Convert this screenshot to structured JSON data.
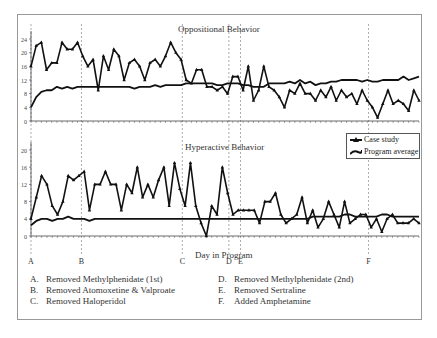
{
  "chart_data": [
    {
      "type": "line",
      "title": "Oppositional Behavior",
      "xlabel": "Day in Program",
      "ylabel": "",
      "ylim": [
        0,
        26
      ],
      "yticks": [
        0,
        4,
        8,
        12,
        16,
        20,
        24
      ],
      "series": [
        {
          "name": "Case study",
          "marker": "triangle",
          "values": [
            16,
            22,
            23,
            15,
            17,
            17,
            23,
            21,
            21,
            23,
            19,
            16,
            18,
            9,
            19,
            15,
            21,
            19,
            12,
            17,
            18,
            16,
            12,
            17,
            18,
            16,
            19,
            23,
            20,
            18,
            12,
            11,
            15,
            15,
            10,
            10,
            9,
            10,
            8,
            13,
            13,
            9,
            16,
            6,
            9,
            16,
            10,
            9,
            7,
            4,
            9,
            8,
            11,
            8,
            8,
            6,
            9,
            7,
            10,
            6,
            9,
            7,
            8,
            5,
            9,
            6,
            4,
            1,
            5,
            9,
            5,
            6,
            5,
            3,
            9,
            6
          ]
        },
        {
          "name": "Program average",
          "values": [
            4,
            7,
            8.5,
            9,
            9,
            10,
            9.5,
            10,
            9.5,
            10,
            10,
            10,
            10,
            10,
            10,
            10,
            10,
            10,
            10,
            10,
            9.5,
            10,
            10,
            10,
            10.5,
            10,
            10.5,
            10.5,
            10.5,
            10.5,
            11,
            11,
            11,
            11,
            11,
            11,
            10.5,
            10.5,
            11,
            11,
            11,
            10.5,
            10.5,
            10,
            10,
            10,
            11,
            11,
            11,
            11,
            11.5,
            11,
            12,
            11,
            11.5,
            10.5,
            11,
            11,
            11.5,
            11.5,
            12,
            12,
            12,
            12,
            11.5,
            12,
            11.5,
            11.5,
            12,
            12,
            12,
            12,
            13,
            12,
            12.5,
            13
          ]
        }
      ],
      "vertical_markers": [
        "A",
        "B",
        "C",
        "D",
        "E",
        "F"
      ]
    },
    {
      "type": "line",
      "title": "Hyperactive Behavior",
      "xlabel": "Day in Program",
      "ylabel": "",
      "ylim": [
        0,
        20
      ],
      "yticks": [
        0,
        4,
        8,
        12,
        16,
        20
      ],
      "series": [
        {
          "name": "Case study",
          "marker": "triangle",
          "values": [
            4,
            9,
            14,
            12,
            7,
            5,
            8,
            14,
            13,
            14,
            15,
            6,
            12,
            12,
            15,
            12,
            12,
            6,
            12,
            10,
            16,
            9,
            12,
            9,
            13,
            16,
            7,
            17,
            11,
            7,
            17,
            7,
            3,
            0,
            7,
            5,
            16,
            10,
            5,
            6,
            6,
            6,
            6,
            3,
            8,
            8,
            10,
            5,
            3,
            4,
            5,
            9,
            3,
            6,
            2,
            4,
            8,
            5,
            2,
            8,
            3,
            4,
            5,
            5,
            2,
            4,
            1,
            4,
            5,
            3,
            3,
            3,
            4,
            3
          ]
        },
        {
          "name": "Program average",
          "values": [
            2.5,
            3.5,
            4,
            4,
            3.5,
            4,
            4,
            4.5,
            4,
            4,
            4,
            3.5,
            4,
            4,
            4,
            4,
            4,
            4,
            4,
            4,
            4,
            4,
            4,
            4,
            4,
            4,
            4,
            4,
            4,
            4,
            4,
            4,
            4,
            4,
            4,
            4,
            4,
            4,
            4,
            4,
            4,
            4,
            4,
            4,
            4,
            4,
            4,
            4,
            4,
            4,
            4,
            4,
            4,
            4.5,
            4.5,
            4.5,
            4.5,
            4.5,
            4.5,
            5,
            5,
            4.5,
            4.5,
            4.5,
            4.5,
            4.5,
            5,
            5,
            4.5,
            4.5,
            4.5,
            4.5,
            4.5,
            4.5
          ]
        }
      ],
      "vertical_markers": [
        "A",
        "B",
        "C",
        "D",
        "E",
        "F"
      ]
    }
  ],
  "legend": {
    "case_study": "Case study",
    "program_average": "Program average"
  },
  "titles": {
    "top": "Oppositional Behavior",
    "bottom": "Hyperactive Behavior"
  },
  "xlabel": "Day in Program",
  "markers": {
    "labels": [
      "A",
      "B",
      "C",
      "D",
      "E",
      "F"
    ],
    "x_fraction": [
      0.0,
      0.13,
      0.39,
      0.51,
      0.54,
      0.87
    ]
  },
  "notes": [
    {
      "key": "A.",
      "text": "Removed Methylphenidate (1st)"
    },
    {
      "key": "B.",
      "text": "Removed Atomoxetine & Valproate"
    },
    {
      "key": "C.",
      "text": "Removed Haloperidol"
    },
    {
      "key": "D.",
      "text": "Removed Methylphenidate (2nd)"
    },
    {
      "key": "E.",
      "text": "Removed Sertraline"
    },
    {
      "key": "F.",
      "text": "Added Amphetamine"
    }
  ]
}
